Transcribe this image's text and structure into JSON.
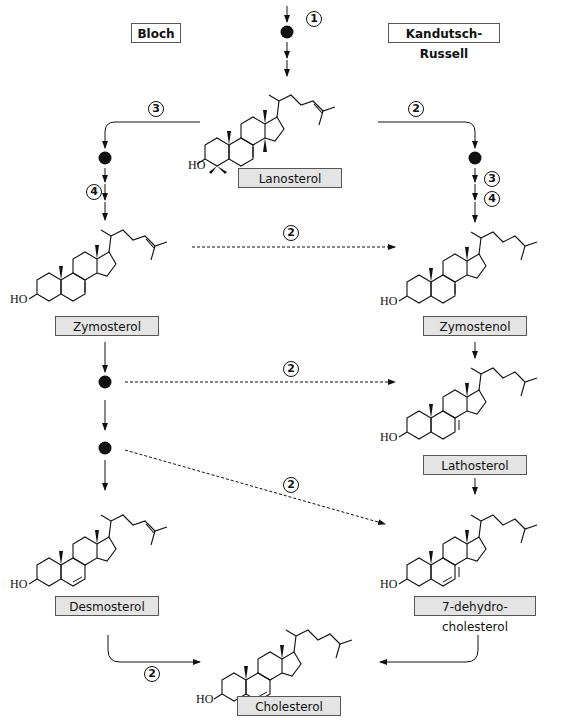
{
  "pathways": {
    "left": {
      "title": "Bloch"
    },
    "right": {
      "title": "Kandutsch-Russell"
    }
  },
  "molecules": {
    "lanosterol": {
      "name": "Lanosterol",
      "substituent": "HO"
    },
    "zymosterol": {
      "name": "Zymosterol",
      "substituent": "HO"
    },
    "zymostenol": {
      "name": "Zymostenol",
      "substituent": "HO"
    },
    "lathosterol": {
      "name": "Lathosterol",
      "substituent": "HO"
    },
    "desmosterol": {
      "name": "Desmosterol",
      "substituent": "HO"
    },
    "dehydrocholesterol": {
      "name": "7-dehydro-cholesterol",
      "substituent": "HO"
    },
    "cholesterol": {
      "name": "Cholesterol",
      "substituent": "HO"
    }
  },
  "steps": {
    "s1": "1",
    "s2": "2",
    "s3": "3",
    "s4": "4"
  },
  "colors": {
    "label_fill": "#e4e4e4",
    "line": "#111111"
  }
}
